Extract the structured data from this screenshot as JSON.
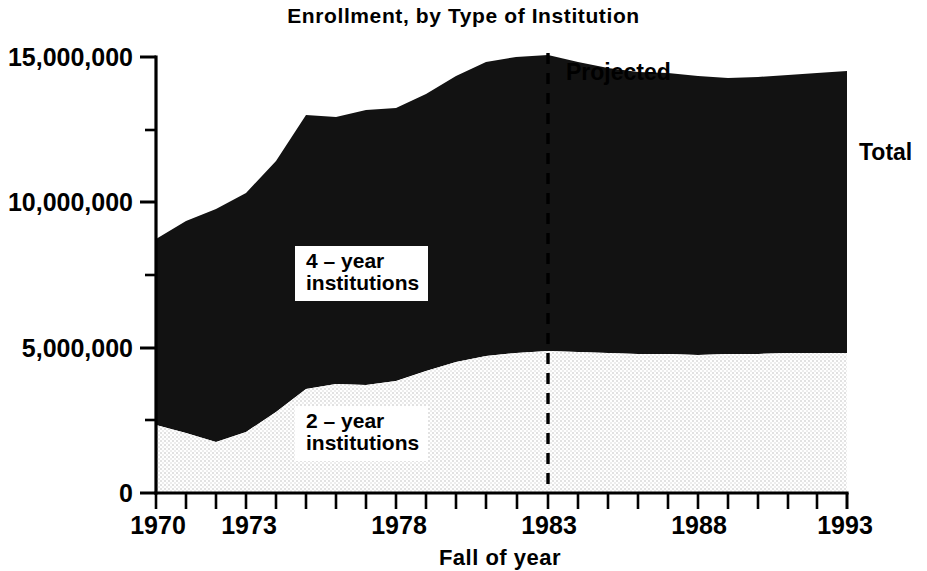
{
  "chart_data": {
    "type": "area",
    "title": "Enrollment, by Type of Institution",
    "subtitle": "",
    "xlabel": "Fall of year",
    "ylabel": "",
    "stacked": true,
    "grid": false,
    "legend_position": "inline-on-plot",
    "xlim": [
      1970,
      1993
    ],
    "ylim": [
      0,
      15000000
    ],
    "ytick_labels": [
      "0",
      "5,000,000",
      "10,000,000",
      "15,000,000"
    ],
    "ytick_values": [
      0,
      5000000,
      10000000,
      15000000
    ],
    "yminor_values": [
      2500000,
      7500000,
      12500000
    ],
    "xtick_labels": [
      "1970",
      "1973",
      "1978",
      "1983",
      "1988",
      "1993"
    ],
    "xtick_values": [
      1970,
      1973,
      1978,
      1983,
      1988,
      1993
    ],
    "xminor_step": 1,
    "x": [
      1970,
      1971,
      1972,
      1973,
      1974,
      1975,
      1976,
      1977,
      1978,
      1979,
      1980,
      1981,
      1982,
      1983,
      1984,
      1985,
      1986,
      1987,
      1988,
      1989,
      1990,
      1991,
      1992,
      1993
    ],
    "series": [
      {
        "name": "2-year institutions",
        "label": "2 – year institutions",
        "fill": "#f2f2f2",
        "values": [
          2300000,
          2550000,
          2750000,
          3000000,
          3400000,
          3950000,
          4100000,
          4150000,
          4250000,
          4450000,
          4700000,
          4850000,
          4900000,
          5000000,
          4950000,
          4920000,
          4900000,
          4900000,
          4880000,
          4850000,
          4830000,
          4820000,
          4820000,
          4830000
        ]
      },
      {
        "name": "4-year institutions",
        "label": "4 – year institutions",
        "fill": "#121212",
        "values": [
          6300000,
          6450000,
          6500000,
          6600000,
          6900000,
          7350000,
          7150000,
          7250000,
          7200000,
          7300000,
          7450000,
          7600000,
          7650000,
          7600000,
          7500000,
          7400000,
          7330000,
          7300000,
          7270000,
          7250000,
          7280000,
          7330000,
          7380000,
          7420000
        ]
      }
    ],
    "total_label": "Total",
    "totals": [
      8600000,
      9000000,
      9250000,
      9600000,
      10300000,
      11300000,
      11250000,
      11400000,
      11450000,
      11750000,
      12150000,
      12450000,
      12550000,
      12600000,
      12450000,
      12320000,
      12230000,
      12200000,
      12150000,
      12100000,
      12110000,
      12150000,
      12200000,
      12250000
    ],
    "annotations": [
      {
        "name": "projected-divider",
        "label": "Projected",
        "x_value": 1983,
        "style": "dashed-vertical-line"
      },
      {
        "name": "total-series-label",
        "label": "Total",
        "x_value": 1993,
        "style": "right-edge-text"
      }
    ]
  }
}
